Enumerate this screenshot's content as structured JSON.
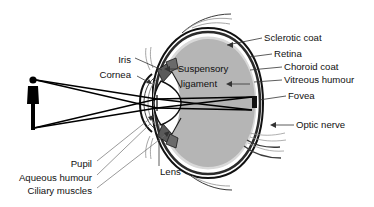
{
  "figure": {
    "background": "#ffffff",
    "colors": {
      "vitreous_fill": "#b5b5b5",
      "sclera_outline": "#111111",
      "choroid": "#2b2b2b",
      "retina": "#ffffff",
      "lens_fill": "#ffffff",
      "iris_fill": "#5a5a5a",
      "ciliary_fill": "#6a6a6a",
      "silhouette": "#000000",
      "text": "#111111",
      "leader": "#333333",
      "muscle": "#8f8f8f"
    }
  },
  "labels": {
    "left": [
      {
        "id": "iris",
        "text": "Iris",
        "x": 131,
        "y": 60
      },
      {
        "id": "cornea",
        "text": "Cornea",
        "x": 131,
        "y": 75
      }
    ],
    "right": [
      {
        "id": "sclerotic-coat",
        "text": "Sclerotic coat",
        "x": 264,
        "y": 38
      },
      {
        "id": "retina",
        "text": "Retina",
        "x": 274,
        "y": 54
      },
      {
        "id": "choroid-coat",
        "text": "Choroid coat",
        "x": 284,
        "y": 67
      },
      {
        "id": "vitreous-humour",
        "text": "Vitreous humour",
        "x": 284,
        "y": 80
      },
      {
        "id": "fovea",
        "text": "Fovea",
        "x": 288,
        "y": 96
      },
      {
        "id": "optic-nerve",
        "text": "Optic nerve",
        "x": 296,
        "y": 125
      }
    ],
    "bottom_left": [
      {
        "id": "pupil",
        "text": "Pupil",
        "x": 92,
        "y": 164
      },
      {
        "id": "aqueous-humour",
        "text": "Aqueous humour",
        "x": 92,
        "y": 178
      },
      {
        "id": "ciliary-muscles",
        "text": "Ciliary muscles",
        "x": 92,
        "y": 191
      }
    ],
    "inner": [
      {
        "id": "suspensory-ligament-line1",
        "text": "Suspensory",
        "x": 203,
        "y": 69
      },
      {
        "id": "suspensory-ligament-line2",
        "text": "ligament",
        "x": 199,
        "y": 84
      }
    ],
    "bottom_center": [
      {
        "id": "lens",
        "text": "Lens",
        "x": 160,
        "y": 172
      }
    ]
  },
  "observer": {
    "id": "person-silhouette",
    "description": "black standing human figure, light source object",
    "x": 30,
    "y": 78,
    "height": 52
  },
  "light_rays": {
    "description": "rays from head and feet of observer crossing at the lens and forming an inverted image on the retina",
    "count": 4
  }
}
